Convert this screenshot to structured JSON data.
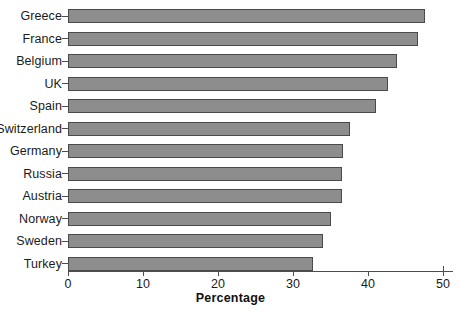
{
  "chart_data": {
    "type": "bar",
    "orientation": "horizontal",
    "title": "",
    "subtitle": "",
    "xlabel": "Percentage",
    "ylabel": "",
    "categories": [
      "Greece",
      "France",
      "Belgium",
      "UK",
      "Spain",
      "Switzerland",
      "Germany",
      "Russia",
      "Austria",
      "Norway",
      "Sweden",
      "Turkey"
    ],
    "values": [
      47.6,
      46.7,
      43.9,
      42.7,
      41.1,
      37.6,
      36.7,
      36.5,
      36.5,
      35.1,
      34.0,
      32.7
    ],
    "xlim": [
      0,
      52
    ],
    "xticks": [
      0,
      10,
      20,
      30,
      40,
      50
    ],
    "xtick_labels": [
      "0",
      "10",
      "20",
      "30",
      "40",
      "50"
    ],
    "grid": false,
    "legend": null,
    "legend_position": "none",
    "bar_fill_color": "#8d8d8d",
    "bar_edge_color": "#4a4a4a",
    "axis_color": "#4d4d4d",
    "background_color": "#ffffff",
    "text_color": "#1a1a1a"
  },
  "axis": {
    "x_title": "Percentage"
  }
}
